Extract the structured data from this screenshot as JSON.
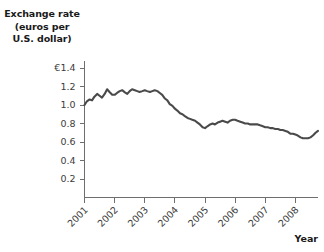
{
  "chart_data": {
    "type": "line",
    "title": "",
    "ylabel_lines": [
      "Exchange rate",
      "(euros per",
      "U.S. dollar)"
    ],
    "ylabel": "Exchange rate (euros per U.S. dollar)",
    "xlabel": "Year",
    "grid": false,
    "legend": null,
    "line_color": "#4a4a4a",
    "axis_color": "#6e6e6e",
    "xlim": [
      2001,
      2008.75
    ],
    "ylim": [
      0,
      1.4
    ],
    "y_ticks": [
      0.2,
      0.4,
      0.6,
      0.8,
      1.0,
      1.2,
      1.4
    ],
    "y_tick_labels": [
      "0.2",
      "0.4",
      "0.6",
      "0.8",
      "1.0",
      "1.2",
      "€1.4"
    ],
    "x_ticks": [
      2001,
      2002,
      2003,
      2004,
      2005,
      2006,
      2007,
      2008
    ],
    "x_tick_labels": [
      "2001",
      "2002",
      "2003",
      "2004",
      "2005",
      "2006",
      "2007",
      "2008"
    ],
    "series": [
      {
        "name": "Euros per U.S. dollar",
        "x": [
          2001.0,
          2001.08,
          2001.17,
          2001.25,
          2001.33,
          2001.42,
          2001.5,
          2001.58,
          2001.67,
          2001.75,
          2001.83,
          2001.92,
          2002.0,
          2002.08,
          2002.17,
          2002.25,
          2002.33,
          2002.42,
          2002.5,
          2002.58,
          2002.67,
          2002.75,
          2002.83,
          2002.92,
          2003.0,
          2003.08,
          2003.17,
          2003.25,
          2003.33,
          2003.42,
          2003.5,
          2003.58,
          2003.67,
          2003.75,
          2003.83,
          2003.92,
          2004.0,
          2004.08,
          2004.17,
          2004.25,
          2004.33,
          2004.42,
          2004.5,
          2004.58,
          2004.67,
          2004.75,
          2004.83,
          2004.92,
          2005.0,
          2005.08,
          2005.17,
          2005.25,
          2005.33,
          2005.42,
          2005.5,
          2005.58,
          2005.67,
          2005.75,
          2005.83,
          2005.92,
          2006.0,
          2006.08,
          2006.17,
          2006.25,
          2006.33,
          2006.42,
          2006.5,
          2006.58,
          2006.67,
          2006.75,
          2006.83,
          2006.92,
          2007.0,
          2007.08,
          2007.17,
          2007.25,
          2007.33,
          2007.42,
          2007.5,
          2007.58,
          2007.67,
          2007.75,
          2007.83,
          2007.92,
          2008.0,
          2008.08,
          2008.17,
          2008.25,
          2008.33,
          2008.42,
          2008.5,
          2008.58,
          2008.67,
          2008.75
        ],
        "values": [
          1.0,
          1.04,
          1.06,
          1.05,
          1.09,
          1.12,
          1.1,
          1.08,
          1.12,
          1.17,
          1.14,
          1.11,
          1.11,
          1.13,
          1.15,
          1.16,
          1.14,
          1.12,
          1.15,
          1.17,
          1.16,
          1.15,
          1.14,
          1.15,
          1.16,
          1.15,
          1.14,
          1.15,
          1.16,
          1.15,
          1.13,
          1.11,
          1.07,
          1.05,
          1.01,
          0.99,
          0.96,
          0.94,
          0.91,
          0.9,
          0.88,
          0.86,
          0.85,
          0.84,
          0.83,
          0.81,
          0.79,
          0.76,
          0.75,
          0.77,
          0.79,
          0.8,
          0.79,
          0.81,
          0.82,
          0.83,
          0.82,
          0.81,
          0.83,
          0.84,
          0.84,
          0.83,
          0.82,
          0.81,
          0.8,
          0.8,
          0.79,
          0.79,
          0.79,
          0.79,
          0.78,
          0.77,
          0.76,
          0.76,
          0.75,
          0.75,
          0.74,
          0.74,
          0.73,
          0.73,
          0.72,
          0.71,
          0.69,
          0.69,
          0.68,
          0.67,
          0.65,
          0.64,
          0.64,
          0.64,
          0.65,
          0.67,
          0.7,
          0.72
        ]
      }
    ]
  }
}
